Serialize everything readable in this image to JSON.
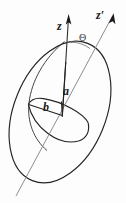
{
  "figure": {
    "kind": "geometry-diagram",
    "background_color": "#fdfdfd",
    "ink_color": "#1a1a1a",
    "faint_ink_color": "#8d8d95"
  },
  "labels": {
    "z_axis": "z",
    "z_prime_axis": "z′",
    "tilt_angle": "Θ",
    "semi_major": "a",
    "semi_minor": "b"
  },
  "geometry": {
    "spheroid": {
      "center_x": 60,
      "center_y": 112,
      "semi_major_px": 74,
      "semi_minor_px": 46,
      "rotation_deg": 22
    },
    "equatorial_ellipse": {
      "center_x": 58,
      "center_y": 121,
      "semi_major_px": 31,
      "semi_minor_px": 13,
      "rotation_deg": 22
    },
    "z_axis": {
      "x1": 68,
      "y1": 16,
      "x2": 62,
      "y2": 118
    },
    "z_prime_axis": {
      "x1": 113,
      "y1": 14,
      "x2": 16,
      "y2": 196
    },
    "semi_major_segment": {
      "x1": 62,
      "y1": 115,
      "x2": 66,
      "y2": 62
    },
    "semi_minor_segment": {
      "x1": 62,
      "y1": 115,
      "x2": 28,
      "y2": 104
    },
    "angle_arc_radius": 36
  }
}
